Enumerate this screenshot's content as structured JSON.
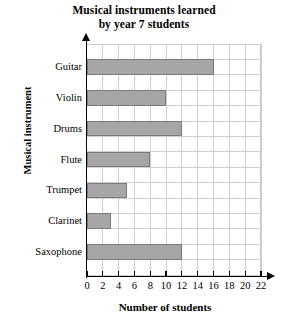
{
  "chart_data": {
    "type": "bar",
    "orientation": "horizontal",
    "title": "Musical instruments learned by year 7 students",
    "title_lines": [
      "Musical instruments learned",
      "by year 7 students"
    ],
    "categories": [
      "Guitar",
      "Violin",
      "Drums",
      "Flute",
      "Trumpet",
      "Clarinet",
      "Saxophone"
    ],
    "values": [
      16,
      10,
      12,
      8,
      5,
      3,
      12
    ],
    "xlabel": "Number of students",
    "ylabel": "Musical instrument",
    "xlim": [
      0,
      22
    ],
    "xticks": [
      0,
      2,
      4,
      6,
      8,
      10,
      12,
      14,
      16,
      18,
      20,
      22
    ],
    "xtick_labels": [
      "0",
      "2",
      "4",
      "6",
      "8",
      "10",
      "12",
      "14",
      "16",
      "18",
      "20",
      "22"
    ],
    "grid": true,
    "legend": false,
    "bar_color": "#a6a6a6",
    "bar_edge_color": "#7a7a7a",
    "grid_color": "#cfcfcf",
    "axis_color": "#000000"
  }
}
